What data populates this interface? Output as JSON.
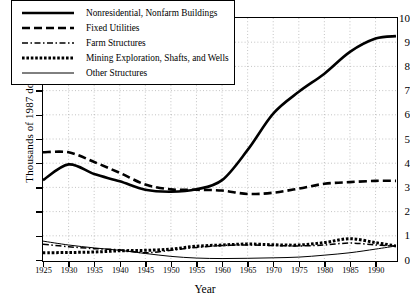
{
  "chart_data": {
    "type": "line",
    "title": "",
    "xlabel": "Year",
    "ylabel": "Thousands of 1987 dollars, per capita",
    "xlim": [
      1925,
      1994
    ],
    "ylim": [
      0,
      10
    ],
    "xticks": [
      1925,
      1930,
      1935,
      1940,
      1945,
      1950,
      1955,
      1960,
      1965,
      1970,
      1975,
      1980,
      1985,
      1990
    ],
    "yticks": [
      0,
      1,
      2,
      3,
      4,
      5,
      6,
      7,
      8,
      9,
      10
    ],
    "grid": true,
    "legend_position": "top-left",
    "x": [
      1925,
      1930,
      1935,
      1940,
      1945,
      1950,
      1955,
      1960,
      1965,
      1970,
      1975,
      1980,
      1985,
      1990,
      1994
    ],
    "series": [
      {
        "name": "Nonresidential, Nonfarm Buildings",
        "style": "solid-thick",
        "values": [
          3.3,
          3.95,
          3.55,
          3.25,
          2.9,
          2.82,
          2.92,
          3.3,
          4.55,
          6.05,
          6.95,
          7.7,
          8.6,
          9.15,
          9.25
        ]
      },
      {
        "name": "Fixed Utilities",
        "style": "dashed",
        "values": [
          4.45,
          4.45,
          4.05,
          3.6,
          3.12,
          2.92,
          2.9,
          2.87,
          2.73,
          2.78,
          2.95,
          3.15,
          3.22,
          3.27,
          3.27
        ]
      },
      {
        "name": "Farm Structures",
        "style": "dash-dot",
        "values": [
          0.65,
          0.55,
          0.47,
          0.42,
          0.3,
          0.4,
          0.52,
          0.6,
          0.62,
          0.6,
          0.58,
          0.62,
          0.7,
          0.62,
          0.58
        ]
      },
      {
        "name": "Mining Exploration, Shafts, and Wells",
        "style": "dotted-thick",
        "values": [
          0.3,
          0.31,
          0.33,
          0.38,
          0.4,
          0.45,
          0.57,
          0.62,
          0.66,
          0.63,
          0.62,
          0.72,
          0.88,
          0.72,
          0.58
        ]
      },
      {
        "name": "Other Structures",
        "style": "solid-thin",
        "values": [
          0.78,
          0.62,
          0.5,
          0.4,
          0.27,
          0.15,
          0.08,
          0.06,
          0.07,
          0.09,
          0.12,
          0.2,
          0.3,
          0.45,
          0.58
        ]
      }
    ]
  },
  "axes": {
    "ylabel": "Thousands of 1987 dollars, per capita",
    "xlabel": "Year",
    "yticklabels": [
      "10",
      "9",
      "8",
      "7",
      "6",
      "5",
      "4",
      "3",
      "2",
      "1",
      "0"
    ],
    "xticklabels": [
      "1925",
      "1930",
      "1935",
      "1940",
      "1945",
      "1950",
      "1955",
      "1960",
      "1965",
      "1970",
      "1975",
      "1980",
      "1985",
      "1990"
    ]
  },
  "legend": {
    "items": [
      {
        "label": "Nonresidential, Nonfarm Buildings",
        "style": "solid-thick"
      },
      {
        "label": "Fixed Utilities",
        "style": "dashed"
      },
      {
        "label": "Farm Structures",
        "style": "dash-dot"
      },
      {
        "label": "Mining Exploration, Shafts, and Wells",
        "style": "dotted-thick"
      },
      {
        "label": "Other Structures",
        "style": "solid-thin"
      }
    ]
  },
  "colors": {
    "line": "#000000",
    "grid": "#aaaaaa",
    "background": "#ffffff"
  }
}
